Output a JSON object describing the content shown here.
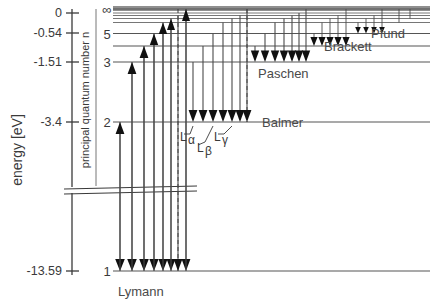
{
  "figure": {
    "kind": "hydrogen-energy-level-diagram",
    "width": 430,
    "height": 304
  },
  "axis": {
    "title": "energy [eV]",
    "ticks": [
      {
        "label": "0",
        "value": 0,
        "y": 13
      },
      {
        "label": "-0.54",
        "value": -0.54,
        "y": 33
      },
      {
        "label": "-1.51",
        "value": -1.51,
        "y": 62
      },
      {
        "label": "-3.4",
        "value": -3.4,
        "y": 122
      },
      {
        "label": "-13.59",
        "value": -13.59,
        "y": 271
      }
    ],
    "break_y": 190
  },
  "quantum_axis": {
    "title": "principal quantum number n",
    "levels": [
      {
        "label": "∞",
        "n": "inf",
        "y": 9
      },
      {
        "label": "5",
        "n": 5,
        "y": 34
      },
      {
        "label": "3",
        "n": 3,
        "y": 62
      },
      {
        "label": "2",
        "n": 2,
        "y": 122
      },
      {
        "label": "1",
        "n": 1,
        "y": 271
      }
    ]
  },
  "levels": [
    {
      "n": "inf",
      "energy": 0,
      "y": 9
    },
    {
      "n": 8,
      "energy": -0.21,
      "y": 15
    },
    {
      "n": 7,
      "energy": -0.28,
      "y": 18
    },
    {
      "n": 6,
      "energy": -0.38,
      "y": 22
    },
    {
      "n": 5,
      "energy": -0.54,
      "y": 34
    },
    {
      "n": 4,
      "energy": -0.85,
      "y": 46
    },
    {
      "n": 3,
      "energy": -1.51,
      "y": 62
    },
    {
      "n": 2,
      "energy": -3.4,
      "y": 122
    },
    {
      "n": 1,
      "energy": -13.59,
      "y": 271
    }
  ],
  "series": [
    {
      "name": "Lymann",
      "final_n": 1,
      "label_x": 118,
      "label_y": 295,
      "arrow_count": 8
    },
    {
      "name": "Balmer",
      "final_n": 2,
      "label_x": 262,
      "label_y": 126,
      "arrow_count": 7
    },
    {
      "name": "Paschen",
      "final_n": 3,
      "label_x": 258,
      "label_y": 76,
      "arrow_count": 7
    },
    {
      "name": "Brackett",
      "final_n": 4,
      "label_x": 324,
      "label_y": 50,
      "arrow_count": 5
    },
    {
      "name": "Pfund",
      "final_n": 5,
      "label_x": 371,
      "label_y": 37,
      "arrow_count": 4
    }
  ],
  "line_labels": [
    {
      "text": "L",
      "greek": "α",
      "x": 181,
      "y": 140
    },
    {
      "text": "L",
      "greek": "β",
      "x": 199,
      "y": 151
    },
    {
      "text": "L",
      "greek": "γ",
      "x": 216,
      "y": 140
    }
  ]
}
